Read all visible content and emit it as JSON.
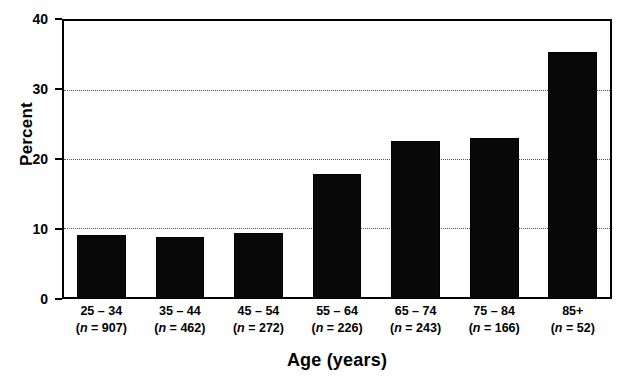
{
  "chart_data": {
    "type": "bar",
    "title": "",
    "xlabel": "Age (years)",
    "ylabel": "Percent",
    "categories": [
      "25 – 34",
      "35 – 44",
      "45 – 54",
      "55 – 64",
      "65 – 74",
      "75 – 84",
      "85+"
    ],
    "group_sizes": [
      "(n = 907)",
      "(n = 462)",
      "(n = 272)",
      "(n = 226)",
      "(n = 243)",
      "(n = 166)",
      "(n = 52)"
    ],
    "values": [
      9.2,
      8.8,
      9.5,
      17.8,
      22.6,
      23.0,
      35.3
    ],
    "ylim": [
      0,
      40
    ],
    "yticks": [
      0,
      10,
      20,
      30,
      40
    ],
    "ytick_labels": [
      "0",
      "10",
      "20",
      "30",
      "40"
    ],
    "gridlines": [
      10,
      20,
      30
    ],
    "grid": "horizontal-dotted",
    "legend": "none",
    "bar_color": "#080808",
    "axis_color": "#000000",
    "grid_color": "#555555",
    "background": "#ffffff"
  },
  "axes": {
    "y_title": "Percent",
    "x_title": "Age (years)"
  },
  "bars": [
    {
      "range": "25 – 34",
      "n_label": "(n = 907)",
      "n_prefix": "(",
      "n_value": "= 907)",
      "value": 9.2
    },
    {
      "range": "35 – 44",
      "n_label": "(n = 462)",
      "n_prefix": "(",
      "n_value": "= 462)",
      "value": 8.8
    },
    {
      "range": "45 – 54",
      "n_label": "(n = 272)",
      "n_prefix": "(",
      "n_value": "= 272)",
      "value": 9.5
    },
    {
      "range": "55 – 64",
      "n_label": "(n = 226)",
      "n_prefix": "(",
      "n_value": "= 226)",
      "value": 17.8
    },
    {
      "range": "65 – 74",
      "n_label": "(n = 243)",
      "n_prefix": "(",
      "n_value": "= 243)",
      "value": 22.6
    },
    {
      "range": "75 – 84",
      "n_label": "(n = 166)",
      "n_prefix": "(",
      "n_value": "= 166)",
      "value": 23.0
    },
    {
      "range": "85+",
      "n_label": "(n = 52)",
      "n_prefix": "(",
      "n_value": "= 52)",
      "value": 35.3
    }
  ],
  "yticks": [
    {
      "label": "40",
      "value": 40
    },
    {
      "label": "30",
      "value": 30
    },
    {
      "label": "20",
      "value": 20
    },
    {
      "label": "10",
      "value": 10
    },
    {
      "label": "0",
      "value": 0
    }
  ]
}
